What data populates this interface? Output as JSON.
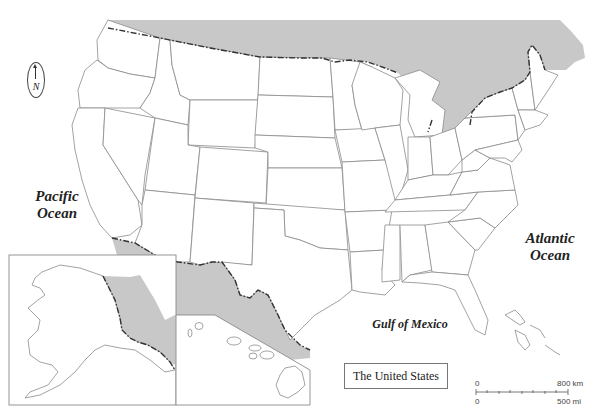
{
  "map": {
    "title": "The United States",
    "labels": {
      "pacific_line1": "Pacific",
      "pacific_line2": "Ocean",
      "atlantic_line1": "Atlantic",
      "atlantic_line2": "Ocean",
      "gulf": "Gulf of Mexico"
    },
    "compass": {
      "letter": "N",
      "icon": "north-arrow-icon"
    },
    "scale_bar": {
      "km_start": "0",
      "km_end": "800 km",
      "mi_start": "0",
      "mi_end": "500 mi"
    },
    "insets": [
      "Alaska",
      "Hawaii"
    ],
    "colors": {
      "land": "#ffffff",
      "foreign_land": "#c8c8c8",
      "state_lines": "#8a8a8a",
      "international_border": "#333333",
      "background": "#ffffff"
    }
  }
}
